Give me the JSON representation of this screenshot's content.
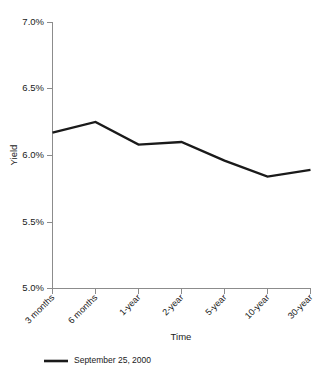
{
  "chart_data": {
    "type": "line",
    "title": "",
    "xlabel": "Time",
    "ylabel": "Yield",
    "categories": [
      "3 months",
      "6 months",
      "1-year",
      "2-year",
      "5-year",
      "10-year",
      "30-year"
    ],
    "series": [
      {
        "name": "September 25, 2000",
        "values": [
          6.17,
          6.25,
          6.08,
          6.1,
          5.96,
          5.84,
          5.89
        ],
        "color": "#1a1a1a"
      }
    ],
    "ylim": [
      5.0,
      7.0
    ],
    "ytick_values": [
      7.0,
      6.5,
      6.0,
      5.5,
      5.0
    ],
    "ytick_labels": [
      "7.0%",
      "6.5%",
      "6.0%",
      "5.5%",
      "5.0%"
    ],
    "grid": false,
    "legend_position": "bottom-left",
    "axis_color": "#8c8c8c"
  },
  "axis": {
    "y_title": "Yield",
    "x_title": "Time"
  },
  "legend": {
    "entries": [
      {
        "label": "September 25, 2000"
      }
    ]
  }
}
